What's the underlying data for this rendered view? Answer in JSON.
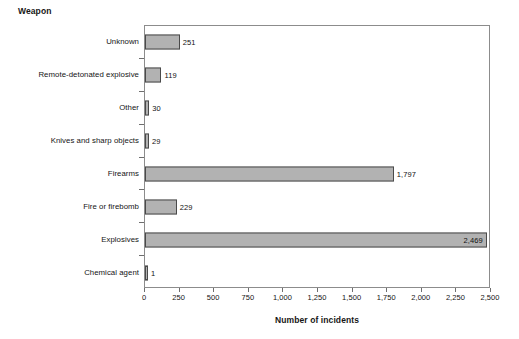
{
  "chart_data": {
    "type": "bar",
    "orientation": "horizontal",
    "title": "",
    "xlabel": "Number of incidents",
    "ylabel": "Weapon",
    "categories": [
      "Unknown",
      "Remote-detonated explosive",
      "Other",
      "Knives and sharp objects",
      "Firearms",
      "Fire or firebomb",
      "Explosives",
      "Chemical agent"
    ],
    "values": [
      251,
      119,
      30,
      29,
      1797,
      229,
      2469,
      1
    ],
    "value_labels": [
      "251",
      "119",
      "30",
      "29",
      "1,797",
      "229",
      "2,469",
      "1"
    ],
    "label_placement": [
      "outside",
      "outside",
      "outside",
      "outside",
      "outside",
      "outside",
      "inside",
      "outside"
    ],
    "xlim": [
      0,
      2500
    ],
    "xticks": [
      0,
      250,
      500,
      750,
      1000,
      1250,
      1500,
      1750,
      2000,
      2250,
      2500
    ],
    "xticklabels": [
      "0",
      "250",
      "500",
      "750",
      "1,000",
      "1,250",
      "1,500",
      "1,750",
      "2,000",
      "2,250",
      "2,500"
    ],
    "grid": false,
    "legend": null,
    "bar_color": "#b2b2b2",
    "bar_edge_color": "#4a4a4a",
    "axis_color": "#8c8c8c",
    "background": "#ffffff"
  }
}
